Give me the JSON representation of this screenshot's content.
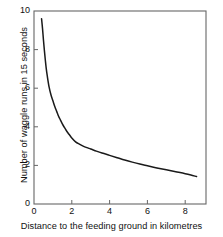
{
  "chart_data": {
    "type": "line",
    "title": "",
    "xlabel": "Distance to the feeding ground in kilometres",
    "ylabel": "Number of waggle runs in 15 seconds",
    "xlim": [
      0,
      9.1
    ],
    "ylim": [
      0,
      10
    ],
    "xticks": [
      "0",
      "2",
      "4",
      "6",
      "8"
    ],
    "xtick_values": [
      0,
      2,
      4,
      6,
      8
    ],
    "yticks": [
      "0",
      "2",
      "4",
      "6",
      "8",
      "10"
    ],
    "ytick_values": [
      0,
      2,
      4,
      6,
      8,
      10
    ],
    "grid": false,
    "legend": false,
    "series": [
      {
        "name": "waggle runs",
        "color": "#1a1a1a",
        "x": [
          0.4,
          0.45,
          0.5,
          0.55,
          0.6,
          0.65,
          0.7,
          0.8,
          0.9,
          1.0,
          1.1,
          1.2,
          1.3,
          1.4,
          1.5,
          1.6,
          1.7,
          1.8,
          1.9,
          2.0,
          2.2,
          2.4,
          2.6,
          2.8,
          3.0,
          3.3,
          3.6,
          4.0,
          4.4,
          4.8,
          5.2,
          5.6,
          6.0,
          6.5,
          7.0,
          7.5,
          8.0,
          8.3,
          8.6
        ],
        "y": [
          9.6,
          9.1,
          8.5,
          7.95,
          7.45,
          7.0,
          6.65,
          6.05,
          5.65,
          5.35,
          5.05,
          4.8,
          4.55,
          4.35,
          4.15,
          3.98,
          3.82,
          3.68,
          3.55,
          3.42,
          3.22,
          3.1,
          3.0,
          2.92,
          2.85,
          2.74,
          2.64,
          2.52,
          2.4,
          2.28,
          2.17,
          2.07,
          1.98,
          1.87,
          1.77,
          1.67,
          1.57,
          1.5,
          1.42
        ]
      }
    ]
  },
  "axes": {
    "frame_color": "#555555",
    "curve_color": "#1a1a1a"
  }
}
